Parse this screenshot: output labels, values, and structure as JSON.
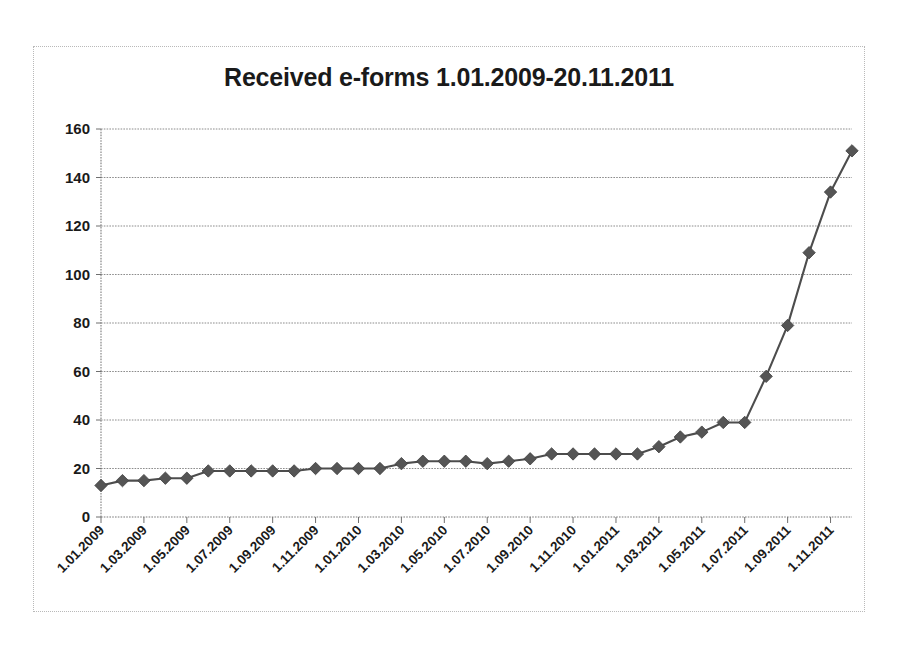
{
  "chart": {
    "title": "Received e-forms 1.01.2009-20.11.2011"
  },
  "axes": {
    "y_ticks": [
      "0",
      "20",
      "40",
      "60",
      "80",
      "100",
      "120",
      "140",
      "160"
    ],
    "x_ticks": [
      "1.01.2009",
      "1.03.2009",
      "1.05.2009",
      "1.07.2009",
      "1.09.2009",
      "1.11.2009",
      "1.01.2010",
      "1.03.2010",
      "1.05.2010",
      "1.07.2010",
      "1.09.2010",
      "1.11.2010",
      "1.01.2011",
      "1.03.2011",
      "1.05.2011",
      "1.07.2011",
      "1.09.2011",
      "1.11.2011"
    ]
  },
  "chart_data": {
    "type": "line",
    "title": "Received e-forms 1.01.2009-20.11.2011",
    "xlabel": "",
    "ylabel": "",
    "ylim": [
      0,
      160
    ],
    "ytick_step": 20,
    "grid": true,
    "legend": "none",
    "marker": "diamond",
    "line_color": "#4d4d4d",
    "marker_color": "#555555",
    "x": [
      "1.01.2009",
      "1.02.2009",
      "1.03.2009",
      "1.04.2009",
      "1.05.2009",
      "1.06.2009",
      "1.07.2009",
      "1.08.2009",
      "1.09.2009",
      "1.10.2009",
      "1.11.2009",
      "1.12.2009",
      "1.01.2010",
      "1.02.2010",
      "1.03.2010",
      "1.04.2010",
      "1.05.2010",
      "1.06.2010",
      "1.07.2010",
      "1.08.2010",
      "1.09.2010",
      "1.10.2010",
      "1.11.2010",
      "1.12.2010",
      "1.01.2011",
      "1.02.2011",
      "1.03.2011",
      "1.04.2011",
      "1.05.2011",
      "1.06.2011",
      "1.07.2011",
      "1.08.2011",
      "1.09.2011",
      "1.10.2011",
      "1.11.2011"
    ],
    "values": [
      13,
      15,
      15,
      16,
      16,
      19,
      19,
      19,
      19,
      19,
      20,
      20,
      20,
      20,
      22,
      23,
      23,
      23,
      22,
      23,
      24,
      26,
      26,
      26,
      26,
      26,
      29,
      33,
      35,
      39,
      39,
      58,
      79,
      109,
      134
    ],
    "final_value": 151,
    "note_extra_point": {
      "x": "20.11.2011",
      "y": 151
    }
  }
}
